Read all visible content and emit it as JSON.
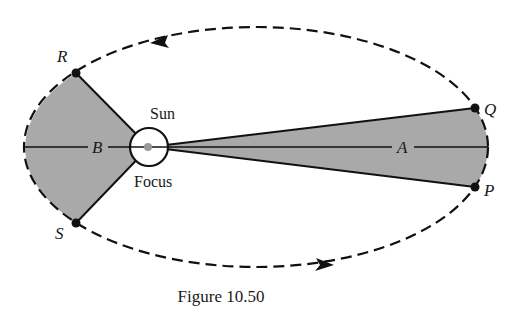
{
  "figure": {
    "caption": "Figure 10.50",
    "colors": {
      "shade": "#a9a9a9",
      "stroke": "#111111",
      "sun_fill": "#ffffff",
      "sun_dot": "#9a9a9a"
    },
    "ellipse": {
      "cx": 256,
      "cy": 147,
      "rx": 232,
      "ry": 120,
      "style": "dashed"
    },
    "focus": {
      "cx": 149,
      "cy": 147,
      "r": 19
    },
    "points": [
      {
        "name": "R",
        "x": 76,
        "y": 73
      },
      {
        "name": "S",
        "x": 76,
        "y": 223
      },
      {
        "name": "Q",
        "x": 475,
        "y": 108
      },
      {
        "name": "P",
        "x": 475,
        "y": 187
      }
    ],
    "labels": {
      "R": "R",
      "S": "S",
      "Q": "Q",
      "P": "P",
      "A": "A",
      "B": "B",
      "sun": "Sun",
      "focus": "Focus"
    },
    "regions": [
      {
        "name": "B",
        "description": "shaded sector from focus to arc R–S (near aphelion side)"
      },
      {
        "name": "A",
        "description": "shaded sector from focus to arc Q–P (far side)"
      }
    ],
    "arrows": [
      {
        "position": "top",
        "direction": "counterclockwise-left"
      },
      {
        "position": "bottom",
        "direction": "right"
      }
    ]
  }
}
